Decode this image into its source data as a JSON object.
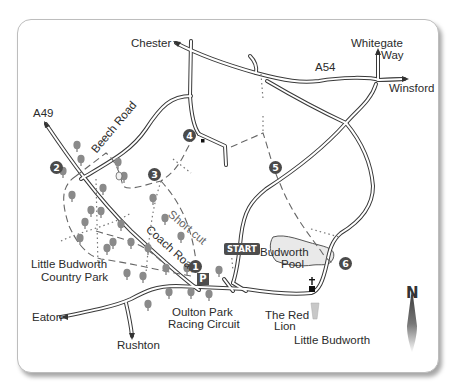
{
  "map": {
    "title": "Little Budworth walk route map",
    "places": {
      "chester": "Chester",
      "whitegate_way": "Whitegate\nWay",
      "whitegate": "Whitegate",
      "way": "Way",
      "a54": "A54",
      "winsford": "Winsford",
      "a49": "A49",
      "beech_road": "Beech Road",
      "coach_road": "Coach Road",
      "short_cut": "Short cut",
      "country_park_line1": "Little Budworth",
      "country_park_line2": "Country Park",
      "budworth_pool_line1": "Budworth",
      "budworth_pool_line2": "Pool",
      "oulton_line1": "Oulton Park",
      "oulton_line2": "Racing Circuit",
      "red_lion_line1": "The Red",
      "red_lion_line2": "Lion",
      "little_budworth": "Little Budworth",
      "eaton": "Eaton",
      "rushton": "Rushton"
    },
    "start_label": "START",
    "parking_label": "P",
    "north_label": "N",
    "waypoints": [
      "1",
      "2",
      "3",
      "4",
      "5",
      "6"
    ],
    "icons": {
      "tree": "tree-icon",
      "church": "church-cross-icon",
      "pub": "pub-glass-icon",
      "parking": "parking-icon",
      "compass": "north-arrow-icon"
    },
    "colors": {
      "road_outline": "#3a3a3a",
      "road_fill": "#ffffff",
      "path": "#666666",
      "tree": "#8a8a8a",
      "marker": "#4a4a4a",
      "pool": "#e9e9e9",
      "frame_border": "#bdbdbd"
    }
  }
}
